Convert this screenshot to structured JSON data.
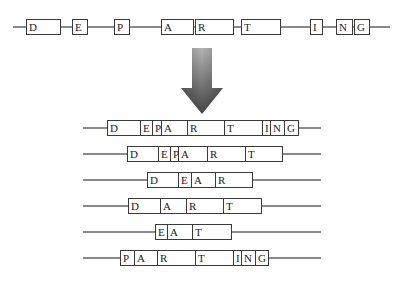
{
  "diagram": {
    "colors": {
      "line": "#8a8a8a",
      "box_border": "#3a3a3a",
      "arrow_top": "#b0b0b0",
      "arrow_bottom": "#4a4a4a"
    },
    "gene": {
      "line": {
        "x1": 13,
        "x2": 390,
        "y": 27
      },
      "box_top": 19,
      "exons": [
        {
          "label": "D",
          "x1": 26,
          "x2": 60
        },
        {
          "label": "E",
          "x1": 72,
          "x2": 87
        },
        {
          "label": "P",
          "x1": 114,
          "x2": 129
        },
        {
          "label": "A",
          "x1": 161,
          "x2": 193
        },
        {
          "label": "R",
          "x1": 195,
          "x2": 233
        },
        {
          "label": "T",
          "x1": 241,
          "x2": 280
        },
        {
          "label": "I",
          "x1": 310,
          "x2": 322
        },
        {
          "label": "N",
          "x1": 336,
          "x2": 352
        },
        {
          "label": "G",
          "x1": 354,
          "x2": 369
        }
      ]
    },
    "arrow": {
      "direction": "down",
      "x": 180,
      "y": 46,
      "width": 44,
      "height": 70
    },
    "isoforms": [
      {
        "y": 120,
        "line": {
          "x1": 83,
          "x2": 321
        },
        "segments": [
          {
            "label": "D",
            "x1": 107,
            "x2": 140
          },
          {
            "label": "E",
            "x1": 140,
            "x2": 152
          },
          {
            "label": "P",
            "x1": 152,
            "x2": 161
          },
          {
            "label": "A",
            "x1": 161,
            "x2": 187
          },
          {
            "label": "R",
            "x1": 187,
            "x2": 224
          },
          {
            "label": "T",
            "x1": 224,
            "x2": 262
          },
          {
            "label": "I",
            "x1": 262,
            "x2": 270
          },
          {
            "label": "N",
            "x1": 270,
            "x2": 284
          },
          {
            "label": "G",
            "x1": 284,
            "x2": 298
          }
        ]
      },
      {
        "y": 146,
        "line": {
          "x1": 83,
          "x2": 321
        },
        "segments": [
          {
            "label": "D",
            "x1": 127,
            "x2": 158
          },
          {
            "label": "E",
            "x1": 158,
            "x2": 170
          },
          {
            "label": "P",
            "x1": 170,
            "x2": 178
          },
          {
            "label": "A",
            "x1": 178,
            "x2": 207
          },
          {
            "label": "R",
            "x1": 207,
            "x2": 245
          },
          {
            "label": "T",
            "x1": 245,
            "x2": 282
          }
        ]
      },
      {
        "y": 172,
        "line": {
          "x1": 83,
          "x2": 321
        },
        "segments": [
          {
            "label": "D",
            "x1": 147,
            "x2": 178
          },
          {
            "label": "E",
            "x1": 178,
            "x2": 191
          },
          {
            "label": "A",
            "x1": 191,
            "x2": 215
          },
          {
            "label": "R",
            "x1": 215,
            "x2": 252
          }
        ]
      },
      {
        "y": 198,
        "line": {
          "x1": 83,
          "x2": 321
        },
        "segments": [
          {
            "label": "D",
            "x1": 128,
            "x2": 160
          },
          {
            "label": "A",
            "x1": 160,
            "x2": 186
          },
          {
            "label": "R",
            "x1": 186,
            "x2": 223
          },
          {
            "label": "T",
            "x1": 223,
            "x2": 261
          }
        ]
      },
      {
        "y": 224,
        "line": {
          "x1": 83,
          "x2": 321
        },
        "segments": [
          {
            "label": "E",
            "x1": 155,
            "x2": 167
          },
          {
            "label": "A",
            "x1": 167,
            "x2": 192
          },
          {
            "label": "T",
            "x1": 192,
            "x2": 231
          }
        ]
      },
      {
        "y": 250,
        "line": {
          "x1": 83,
          "x2": 321
        },
        "segments": [
          {
            "label": "P",
            "x1": 120,
            "x2": 134
          },
          {
            "label": "A",
            "x1": 134,
            "x2": 157
          },
          {
            "label": "R",
            "x1": 157,
            "x2": 195
          },
          {
            "label": "T",
            "x1": 195,
            "x2": 233
          },
          {
            "label": "I",
            "x1": 233,
            "x2": 241
          },
          {
            "label": "N",
            "x1": 241,
            "x2": 255
          },
          {
            "label": "G",
            "x1": 255,
            "x2": 268
          }
        ]
      }
    ]
  }
}
